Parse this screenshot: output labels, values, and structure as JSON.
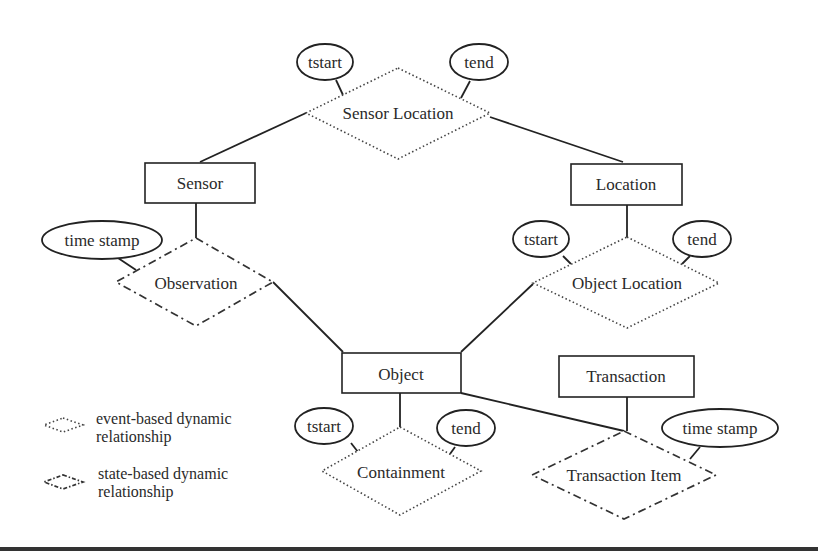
{
  "diagram": {
    "type": "dynamic ER diagram",
    "entities": [
      {
        "id": "sensor",
        "label": "Sensor"
      },
      {
        "id": "location",
        "label": "Location"
      },
      {
        "id": "object",
        "label": "Object"
      },
      {
        "id": "transaction",
        "label": "Transaction"
      }
    ],
    "relationships": [
      {
        "id": "sensor_location",
        "label": "Sensor Location",
        "kind": "event-based",
        "connects": [
          "sensor",
          "location"
        ]
      },
      {
        "id": "observation",
        "label": "Observation",
        "kind": "state-based",
        "connects": [
          "sensor",
          "object"
        ]
      },
      {
        "id": "object_location",
        "label": "Object Location",
        "kind": "event-based",
        "connects": [
          "location",
          "object"
        ]
      },
      {
        "id": "containment",
        "label": "Containment",
        "kind": "event-based",
        "connects": [
          "object"
        ]
      },
      {
        "id": "transaction_item",
        "label": "Transaction Item",
        "kind": "state-based",
        "connects": [
          "object",
          "transaction"
        ]
      }
    ],
    "attributes": {
      "sensor_location_tstart": "tstart",
      "sensor_location_tend": "tend",
      "observation_timestamp": "time stamp",
      "object_location_tstart": "tstart",
      "object_location_tend": "tend",
      "containment_tstart": "tstart",
      "containment_tend": "tend",
      "transaction_item_timestamp": "time stamp"
    },
    "legend": {
      "event_line1": "event-based dynamic",
      "event_line2": "relationship",
      "state_line1": "state-based dynamic",
      "state_line2": "relationship"
    }
  }
}
